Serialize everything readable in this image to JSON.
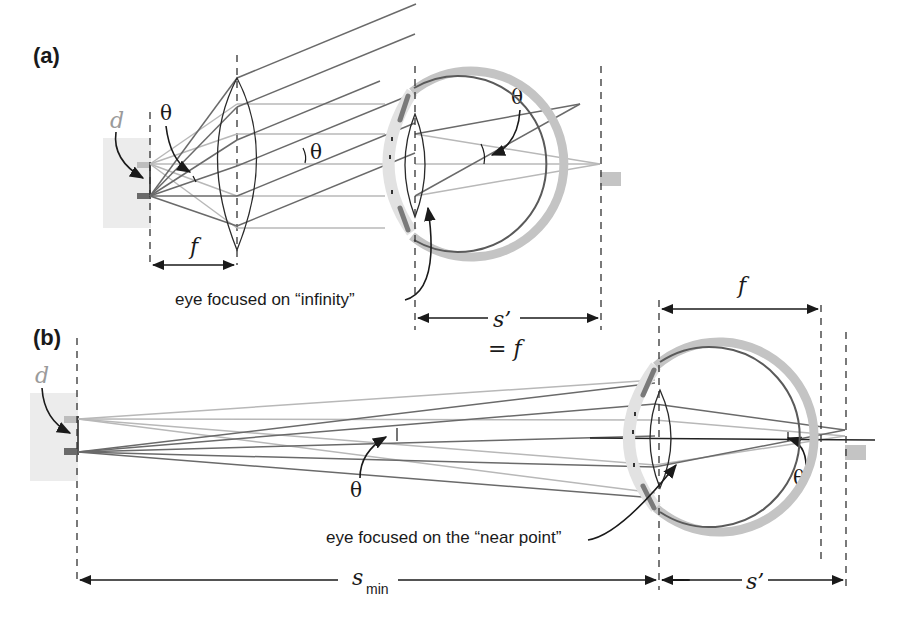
{
  "figure": {
    "panel_a": {
      "label": "(a)",
      "object_label": "d",
      "theta_labels": [
        "θ",
        "θ",
        "θ"
      ],
      "focal_label": "f",
      "caption": "eye focused on “infinity”",
      "image_distance_label": "s’",
      "image_distance_equality": "= f"
    },
    "panel_b": {
      "label": "(b)",
      "object_label": "d",
      "theta_labels": [
        "θ",
        "θ"
      ],
      "focal_label": "f",
      "caption": "eye focused on the “near point”",
      "object_distance_label": "s",
      "object_distance_subscript": "min",
      "image_distance_label": "s’"
    },
    "colors": {
      "dark_ray": "#6a6a6a",
      "light_ray": "#b8b8b8",
      "sclera": "#c4c4c4",
      "cornea": "#e2e2e2",
      "object_background": "#ececec"
    }
  }
}
